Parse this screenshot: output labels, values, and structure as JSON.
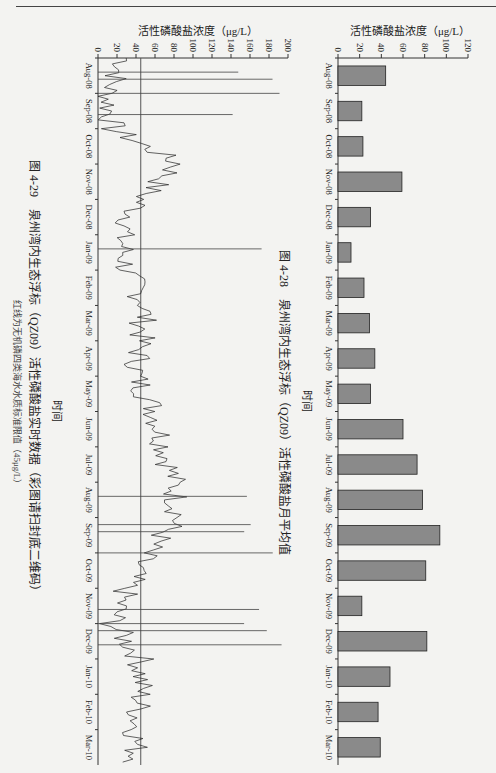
{
  "page": {
    "orientation": "rotated-90"
  },
  "chart_data": [
    {
      "type": "bar",
      "title": "图 4-28　泉州湾内生态浮标（QZ09）活性磷酸盐月平均值",
      "xlabel": "时间",
      "ylabel": "活性磷酸盐浓度（μg/L）",
      "ylim": [
        0,
        120
      ],
      "yticks": [
        0,
        20,
        40,
        60,
        80,
        100,
        120
      ],
      "categories": [
        "Aug-08",
        "Sep-08",
        "Oct-08",
        "Nov-08",
        "Dec-08",
        "Jan-09",
        "Feb-09",
        "Mar-09",
        "Apr-09",
        "May-09",
        "Jun-09",
        "Jul-09",
        "Aug-09",
        "Sep-09",
        "Oct-09",
        "Nov-09",
        "Dec-09",
        "Jan-10",
        "Feb-10",
        "Mar-10"
      ],
      "values": [
        44,
        22,
        23,
        59,
        30,
        12,
        24,
        29,
        34,
        30,
        60,
        73,
        78,
        94,
        81,
        22,
        82,
        48,
        37,
        39
      ],
      "bar_color": "#8a8a8a",
      "grid": false
    },
    {
      "type": "line",
      "title": "图 4-29　泉州湾内生态浮标（QZ09）活性磷酸盐实时数据（彩图请扫封底二维码）",
      "subtitle": "红线为无机磷四类海水水质标准限值（45μg/L）",
      "xlabel": "时间",
      "ylabel": "活性磷酸盐浓度（μg/L）",
      "ylim": [
        0,
        200
      ],
      "yticks": [
        0,
        20,
        40,
        60,
        80,
        100,
        120,
        140,
        160,
        180,
        200
      ],
      "xticks": [
        "Aug-08",
        "Sep-08",
        "Oct-08",
        "Nov-08",
        "Dec-08",
        "Jan-09",
        "Feb-09",
        "Mar-09",
        "Apr-09",
        "May-09",
        "Jun-09",
        "Jul-09",
        "Aug-09",
        "Sep-09",
        "Oct-09",
        "Nov-09",
        "Dec-09",
        "Jan-10",
        "Feb-10",
        "Mar-10"
      ],
      "threshold": {
        "value": 45,
        "label": "四类海水水质标准限值"
      },
      "series": [
        {
          "name": "活性磷酸盐实时数据",
          "x": [
            "Aug-08",
            "Sep-08",
            "Oct-08",
            "Nov-08",
            "Dec-08",
            "Jan-09",
            "Feb-09",
            "Mar-09",
            "Apr-09",
            "May-09",
            "Jun-09",
            "Jul-09",
            "Aug-09",
            "Sep-09",
            "Oct-09",
            "Nov-09",
            "Dec-09",
            "Jan-10",
            "Feb-10",
            "Mar-10"
          ],
          "values": [
            30,
            10,
            15,
            85,
            45,
            25,
            30,
            50,
            45,
            40,
            60,
            70,
            80,
            85,
            50,
            30,
            15,
            45,
            45,
            40
          ]
        }
      ],
      "grid": false
    }
  ],
  "figures": {
    "fig1": {
      "caption": "图 4-28　泉州湾内生态浮标（QZ09）活性磷酸盐月平均值",
      "xlabel": "时间",
      "ylabel": "活性磷酸盐浓度（μg/L）"
    },
    "fig2": {
      "caption": "图 4-29　泉州湾内生态浮标（QZ09）活性磷酸盐实时数据（彩图请扫封底二维码）",
      "subcaption": "红线为无机磷四类海水水质标准限值（45μg/L）",
      "xlabel": "时间",
      "ylabel": "活性磷酸盐浓度（μg/L）"
    }
  }
}
